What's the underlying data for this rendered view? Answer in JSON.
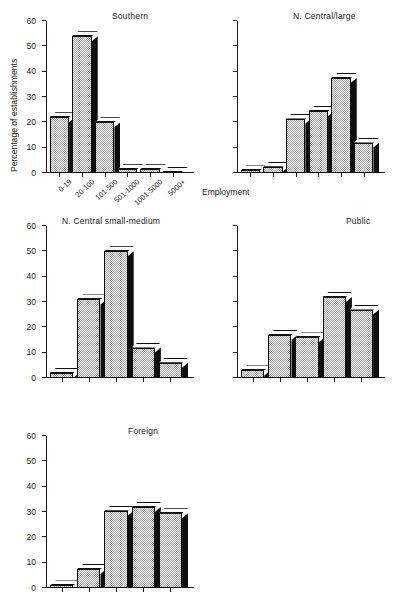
{
  "figure": {
    "ylabel": "Percentage of establishments",
    "xlabel": "Employment",
    "categories": [
      "0-19",
      "20-100",
      "101-500",
      "501-1000",
      "1001-5000",
      "5000+"
    ],
    "yticks": [
      "0",
      "10",
      "20",
      "30",
      "40",
      "50",
      "60"
    ],
    "ylim": [
      0,
      60
    ],
    "colors": {
      "axis": "#1a1a1a",
      "bar_fill": "#cccccc",
      "bar_side": "#0d0d0d",
      "bar_top": "#ffffff",
      "background": "#ffffff"
    }
  },
  "chart_data": [
    {
      "type": "bar",
      "title": "Southern",
      "xlabel": "Employment",
      "ylabel": "Percentage of establishments",
      "categories": [
        "0-19",
        "20-100",
        "101-500",
        "501-1000",
        "1001-5000",
        "5000+"
      ],
      "values": [
        22,
        54,
        20,
        1.5,
        1.5,
        0
      ],
      "ylim": [
        0,
        60
      ],
      "yticks": [
        0,
        10,
        20,
        30,
        40,
        50,
        60
      ],
      "grid": false,
      "legend": null,
      "axis_labels_shown": {
        "y_ticks": true,
        "x_ticks": true,
        "ylabel": true,
        "xlabel": true
      }
    },
    {
      "type": "bar",
      "title": "N. Central/large",
      "xlabel": "",
      "ylabel": "",
      "categories": [
        "0-19",
        "20-100",
        "101-500",
        "501-1000",
        "1001-5000",
        "5000+"
      ],
      "values": [
        1,
        2.5,
        21.5,
        24.5,
        37.5,
        12
      ],
      "ylim": [
        0,
        60
      ],
      "yticks": [
        0,
        10,
        20,
        30,
        40,
        50,
        60
      ],
      "grid": false,
      "legend": null,
      "axis_labels_shown": {
        "y_ticks": false,
        "x_ticks": false,
        "ylabel": false,
        "xlabel": false
      }
    },
    {
      "type": "bar",
      "title": "N. Central small-medium",
      "xlabel": "",
      "ylabel": "",
      "categories": [
        "0-19",
        "20-100",
        "101-500",
        "501-1000",
        "1001-5000"
      ],
      "values": [
        2,
        31,
        50,
        12,
        6
      ],
      "ylim": [
        0,
        60
      ],
      "yticks": [
        0,
        10,
        20,
        30,
        40,
        50,
        60
      ],
      "grid": false,
      "legend": null,
      "axis_labels_shown": {
        "y_ticks": true,
        "x_ticks": false,
        "ylabel": false,
        "xlabel": false
      }
    },
    {
      "type": "bar",
      "title": "Public",
      "xlabel": "",
      "ylabel": "",
      "categories": [
        "0-19",
        "20-100",
        "101-500",
        "501-1000",
        "1001-5000"
      ],
      "values": [
        3,
        17,
        16,
        32,
        27
      ],
      "ylim": [
        0,
        60
      ],
      "yticks": [
        0,
        10,
        20,
        30,
        40,
        50,
        60
      ],
      "grid": false,
      "legend": null,
      "axis_labels_shown": {
        "y_ticks": false,
        "x_ticks": false,
        "ylabel": false,
        "xlabel": false
      }
    },
    {
      "type": "bar",
      "title": "Foreign",
      "xlabel": "",
      "ylabel": "",
      "categories": [
        "0-19",
        "20-100",
        "101-500",
        "501-1000",
        "1001-5000"
      ],
      "values": [
        1,
        7.5,
        30.5,
        32,
        29.5
      ],
      "ylim": [
        0,
        60
      ],
      "yticks": [
        0,
        10,
        20,
        30,
        40,
        50,
        60
      ],
      "grid": false,
      "legend": null,
      "axis_labels_shown": {
        "y_ticks": true,
        "x_ticks": false,
        "ylabel": false,
        "xlabel": false
      }
    }
  ]
}
